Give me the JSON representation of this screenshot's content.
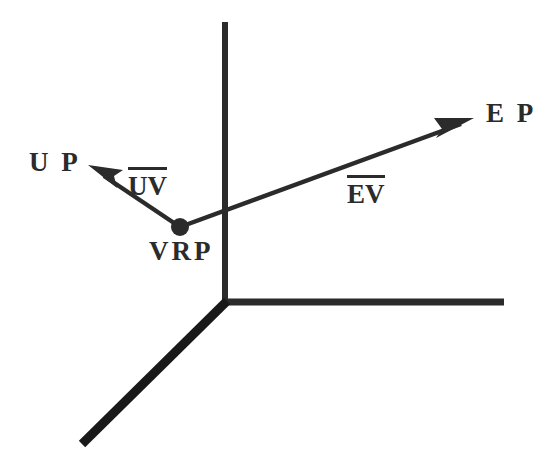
{
  "figure": {
    "background_color": "#ffffff",
    "stroke_color": "#2b2b2b"
  },
  "labels": {
    "ep": "E P",
    "up": "U P",
    "vrp": "VRP",
    "uv": "UV",
    "ev": "EV"
  },
  "icons": {
    "vrp_point": "filled-dot",
    "ep_arrow": "arrowhead",
    "up_arrow": "arrowhead"
  },
  "geometry": {
    "vrp_point": {
      "x": 180,
      "y": 227,
      "r": 9
    },
    "axes": {
      "origin": {
        "x": 225,
        "y": 302
      },
      "vertical_top": {
        "x": 225,
        "y": 22
      },
      "horizontal_right": {
        "x": 504,
        "y": 302
      },
      "diagonal_end": {
        "x": 82,
        "y": 444
      }
    },
    "vectors": [
      {
        "name": "EV",
        "from": {
          "x": 180,
          "y": 227
        },
        "to": {
          "x": 474,
          "y": 119
        }
      },
      {
        "name": "UV",
        "from": {
          "x": 180,
          "y": 227
        },
        "to": {
          "x": 89,
          "y": 166
        }
      }
    ]
  }
}
